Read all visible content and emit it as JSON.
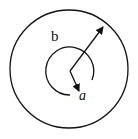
{
  "diagram": {
    "labels": {
      "outer": "b",
      "inner": "a"
    },
    "outer_circle": {
      "cx": 69,
      "cy": 69,
      "r": 59
    },
    "inner_arc": {
      "cx": 70,
      "cy": 71,
      "r": 24
    },
    "colors": {
      "stroke": "#111111",
      "background": "#ffffff"
    }
  }
}
